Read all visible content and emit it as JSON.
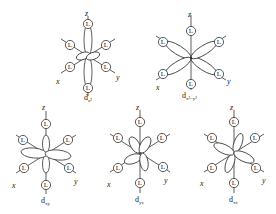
{
  "figure": {
    "type": "d-orbital ligand field diagrams (octahedral)",
    "ligand_label": "L",
    "axis_labels": {
      "x": "x",
      "y": "y",
      "z": "z"
    },
    "orbitals": [
      {
        "id": "dz2",
        "label_main": "d",
        "label_sub": "z²",
        "position": "top-left"
      },
      {
        "id": "dx2y2",
        "label_main": "d",
        "label_sub": "x²−y²",
        "position": "top-right"
      },
      {
        "id": "dxy",
        "label_main": "d",
        "label_sub": "xy",
        "position": "bottom-left"
      },
      {
        "id": "dyz",
        "label_main": "d",
        "label_sub": "yz",
        "position": "bottom-middle"
      },
      {
        "id": "dxz",
        "label_main": "d",
        "label_sub": "xz",
        "position": "bottom-right"
      }
    ]
  },
  "colors": {
    "line": "#333333",
    "background": "#ffffff"
  }
}
